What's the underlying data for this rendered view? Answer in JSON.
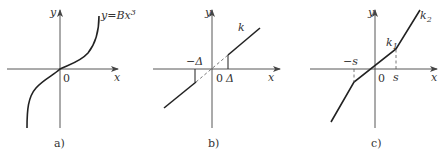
{
  "panels": [
    {
      "id": "a",
      "caption": "a)",
      "axes": {
        "x_label": "x",
        "y_label": "y",
        "origin_label": "0"
      },
      "curve_label": "y=Bx",
      "curve_label_exp": "3",
      "description": "cubic characteristic y = Bx^3"
    },
    {
      "id": "b",
      "caption": "b)",
      "axes": {
        "x_label": "x",
        "y_label": "y",
        "origin_label": "0"
      },
      "slope_label": "k",
      "dead_zone_neg": "−Δ",
      "dead_zone_pos": "Δ",
      "description": "dead-zone characteristic with slope k, threshold ±Δ"
    },
    {
      "id": "c",
      "caption": "c)",
      "axes": {
        "x_label": "x",
        "y_label": "y",
        "origin_label": "0"
      },
      "slope1_label": "k",
      "slope1_sub": "1",
      "slope2_label": "k",
      "slope2_sub": "2",
      "break_neg": "−s",
      "break_pos": "s",
      "description": "piecewise-linear characteristic with slopes k1 (|x|<s) and k2 (|x|>s)"
    }
  ]
}
